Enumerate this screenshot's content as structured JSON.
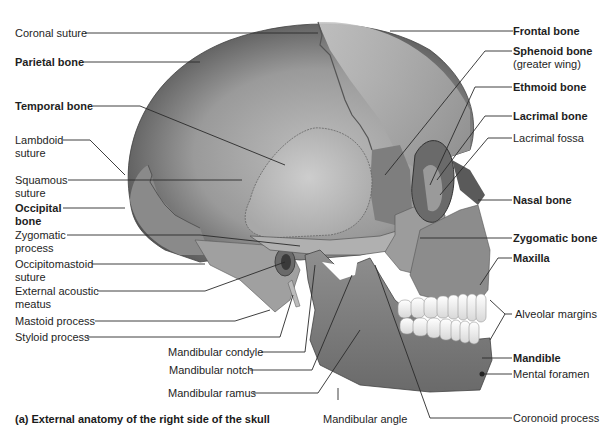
{
  "figure": {
    "caption": "(a) External anatomy of the right side of the skull",
    "colors": {
      "background": "#ffffff",
      "bone_base": "#8f8f8f",
      "bone_light": "#c4c4c4",
      "bone_dark": "#5a5a5a",
      "teeth": "#f2f2f2",
      "leader_line": "#2a2a2a",
      "label_text": "#1e1e1e"
    }
  },
  "labels_left": [
    {
      "id": "coronal-suture",
      "line1": "Coronal suture",
      "line2": "",
      "bold": false
    },
    {
      "id": "parietal-bone",
      "line1": "Parietal bone",
      "line2": "",
      "bold": true
    },
    {
      "id": "temporal-bone",
      "line1": "Temporal bone",
      "line2": "",
      "bold": true
    },
    {
      "id": "lambdoid-suture",
      "line1": "Lambdoid",
      "line2": "suture",
      "bold": false
    },
    {
      "id": "squamous-suture",
      "line1": "Squamous",
      "line2": "suture",
      "bold": false
    },
    {
      "id": "occipital-bone",
      "line1": "Occipital",
      "line2": "bone",
      "bold": true
    },
    {
      "id": "zygomatic-process",
      "line1": "Zygomatic",
      "line2": "process",
      "bold": false
    },
    {
      "id": "occipitomastoid-suture",
      "line1": "Occipitomastoid",
      "line2": "suture",
      "bold": false
    },
    {
      "id": "external-acoustic-meatus",
      "line1": "External acoustic",
      "line2": "meatus",
      "bold": false
    },
    {
      "id": "mastoid-process",
      "line1": "Mastoid process",
      "line2": "",
      "bold": false
    },
    {
      "id": "styloid-process",
      "line1": "Styloid process",
      "line2": "",
      "bold": false
    }
  ],
  "labels_center": [
    {
      "id": "mandibular-condyle",
      "text": "Mandibular condyle",
      "bold": false
    },
    {
      "id": "mandibular-notch",
      "text": "Mandibular notch",
      "bold": false
    },
    {
      "id": "mandibular-ramus",
      "text": "Mandibular ramus",
      "bold": false
    },
    {
      "id": "mandibular-angle",
      "text": "Mandibular angle",
      "bold": false
    }
  ],
  "labels_right": [
    {
      "id": "frontal-bone",
      "line1": "Frontal bone",
      "line2": "",
      "bold": true
    },
    {
      "id": "sphenoid-bone",
      "line1": "Sphenoid bone",
      "line2": "(greater wing)",
      "bold": true
    },
    {
      "id": "ethmoid-bone",
      "line1": "Ethmoid bone",
      "line2": "",
      "bold": true
    },
    {
      "id": "lacrimal-bone",
      "line1": "Lacrimal bone",
      "line2": "",
      "bold": true
    },
    {
      "id": "lacrimal-fossa",
      "line1": "Lacrimal fossa",
      "line2": "",
      "bold": false
    },
    {
      "id": "nasal-bone",
      "line1": "Nasal bone",
      "line2": "",
      "bold": true
    },
    {
      "id": "zygomatic-bone",
      "line1": "Zygomatic bone",
      "line2": "",
      "bold": true
    },
    {
      "id": "maxilla",
      "line1": "Maxilla",
      "line2": "",
      "bold": true
    },
    {
      "id": "alveolar-margins",
      "line1": "Alveolar margins",
      "line2": "",
      "bold": false
    },
    {
      "id": "mandible",
      "line1": "Mandible",
      "line2": "",
      "bold": true
    },
    {
      "id": "mental-foramen",
      "line1": "Mental foramen",
      "line2": "",
      "bold": false
    },
    {
      "id": "coronoid-process",
      "line1": "Coronoid process",
      "line2": "",
      "bold": false
    }
  ]
}
